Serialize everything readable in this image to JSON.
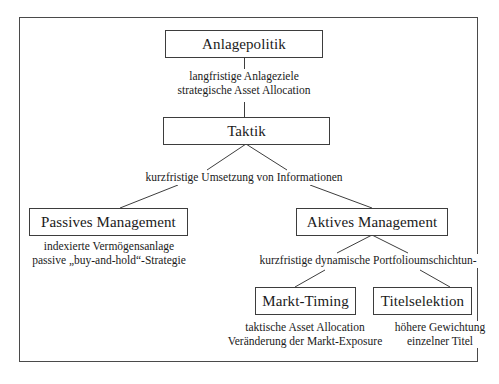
{
  "diagram": {
    "title_nodes": {
      "anlagepolitik": "Anlagepolitik",
      "taktik": "Taktik",
      "passives_management": "Passives Management",
      "aktives_management": "Aktives Management",
      "markt_timing": "Markt-Timing",
      "titelselektion": "Titelselektion"
    },
    "captions": {
      "anlagepolitik_taktik": {
        "line1": "langfristige Anlageziele",
        "line2": "strategische Asset Allocation"
      },
      "taktik_branch": {
        "line1": "kurzfristige Umsetzung von Informationen"
      },
      "passives_detail": {
        "line1": "indexierte Vermögensanlage",
        "line2": "passive „buy-and-hold“-Strategie"
      },
      "aktives_branch": {
        "line1": "kurzfristige dynamische Portfolioumschichtun-"
      },
      "markt_timing_detail": {
        "line1": "taktische Asset Allocation",
        "line2": "Veränderung der Markt-Exposure"
      },
      "titelselektion_detail": {
        "line1": "höhere Gewichtung",
        "line2": "einzelner Titel"
      }
    },
    "colors": {
      "border": "#3d3d3d",
      "frame": "#4a4a4a",
      "text": "#1a1a1a",
      "background": "#ffffff"
    }
  }
}
